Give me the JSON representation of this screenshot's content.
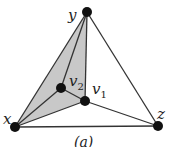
{
  "diagram": {
    "caption": "(a)",
    "colors": {
      "edge": "#333333",
      "vertex": "#111111",
      "shade": "#c8c8c8"
    },
    "vertices": [
      {
        "id": "y",
        "label": "y",
        "x": 87,
        "y": 12,
        "lx": 68,
        "ly": 18
      },
      {
        "id": "x",
        "label": "x",
        "x": 15,
        "y": 127,
        "lx": 4,
        "ly": 121
      },
      {
        "id": "z",
        "label": "z",
        "x": 158,
        "y": 126,
        "lx": 158,
        "ly": 117
      },
      {
        "id": "v1",
        "label": "v1",
        "x": 85,
        "y": 101,
        "lx": 93,
        "ly": 93
      },
      {
        "id": "v2",
        "label": "v2",
        "x": 61,
        "y": 88,
        "lx": 70,
        "ly": 86
      }
    ],
    "edges": [
      [
        "x",
        "y"
      ],
      [
        "y",
        "z"
      ],
      [
        "x",
        "z"
      ],
      [
        "y",
        "v1"
      ],
      [
        "y",
        "v2"
      ],
      [
        "x",
        "v2"
      ],
      [
        "x",
        "v1"
      ],
      [
        "v2",
        "v1"
      ],
      [
        "v1",
        "z"
      ]
    ],
    "shaded_face": [
      "x",
      "y",
      "v1"
    ]
  }
}
